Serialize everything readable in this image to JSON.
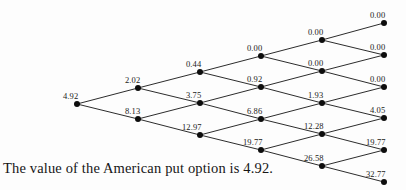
{
  "figure": {
    "caption": "The value of the American put option is 4.92.",
    "background_color": "#fdfdfd",
    "ink_color": "#111111"
  },
  "chart_data": {
    "type": "diagram",
    "subtype": "binomial-tree",
    "title": "",
    "xlabel": "",
    "ylabel": "",
    "steps": 5,
    "node_radius": 3.0,
    "edge_color": "#141414",
    "node_color": "#0d0d0d",
    "label_offset": {
      "dx": -13,
      "dy": -11
    },
    "columns": [
      {
        "index": 0,
        "x": 77,
        "nodes": [
          {
            "row": 0,
            "y": 104,
            "value": "4.92",
            "label_x": 63,
            "label_y": 92
          }
        ]
      },
      {
        "index": 1,
        "x": 138,
        "nodes": [
          {
            "row": 0,
            "y": 88,
            "value": "2.02",
            "label_x": 125,
            "label_y": 76
          },
          {
            "row": 1,
            "y": 119,
            "value": "8.13",
            "label_x": 125,
            "label_y": 107
          }
        ]
      },
      {
        "index": 2,
        "x": 200,
        "nodes": [
          {
            "row": 0,
            "y": 72,
            "value": "0.44",
            "label_x": 186,
            "label_y": 60
          },
          {
            "row": 1,
            "y": 103,
            "value": "3.75",
            "label_x": 186,
            "label_y": 91
          },
          {
            "row": 2,
            "y": 135,
            "value": "12.97",
            "label_x": 182,
            "label_y": 123
          }
        ]
      },
      {
        "index": 3,
        "x": 261,
        "nodes": [
          {
            "row": 0,
            "y": 56,
            "value": "0.00",
            "label_x": 247,
            "label_y": 44
          },
          {
            "row": 1,
            "y": 87,
            "value": "0.92",
            "label_x": 247,
            "label_y": 75
          },
          {
            "row": 2,
            "y": 119,
            "value": "6.86",
            "label_x": 247,
            "label_y": 107
          },
          {
            "row": 3,
            "y": 150,
            "value": "19.77",
            "label_x": 243,
            "label_y": 138
          }
        ]
      },
      {
        "index": 4,
        "x": 322,
        "nodes": [
          {
            "row": 0,
            "y": 40,
            "value": "0.00",
            "label_x": 308,
            "label_y": 28
          },
          {
            "row": 1,
            "y": 71,
            "value": "0.00",
            "label_x": 308,
            "label_y": 59
          },
          {
            "row": 2,
            "y": 103,
            "value": "1.93",
            "label_x": 308,
            "label_y": 91
          },
          {
            "row": 3,
            "y": 134,
            "value": "12.28",
            "label_x": 304,
            "label_y": 122
          },
          {
            "row": 4,
            "y": 166,
            "value": "26.58",
            "label_x": 304,
            "label_y": 154
          }
        ]
      },
      {
        "index": 5,
        "x": 384,
        "nodes": [
          {
            "row": 0,
            "y": 23,
            "value": "0.00",
            "label_x": 370,
            "label_y": 11
          },
          {
            "row": 1,
            "y": 55,
            "value": "0.00",
            "label_x": 370,
            "label_y": 43
          },
          {
            "row": 2,
            "y": 87,
            "value": "0.00",
            "label_x": 370,
            "label_y": 75
          },
          {
            "row": 3,
            "y": 118,
            "value": "4.05",
            "label_x": 370,
            "label_y": 106
          },
          {
            "row": 4,
            "y": 150,
            "value": "19.77",
            "label_x": 366,
            "label_y": 138
          },
          {
            "row": 5,
            "y": 182,
            "value": "32.77",
            "label_x": 366,
            "label_y": 170
          }
        ]
      }
    ],
    "edges": [
      {
        "from": [
          77,
          104
        ],
        "to": [
          138,
          88
        ]
      },
      {
        "from": [
          77,
          104
        ],
        "to": [
          138,
          119
        ]
      },
      {
        "from": [
          138,
          88
        ],
        "to": [
          200,
          72
        ]
      },
      {
        "from": [
          138,
          88
        ],
        "to": [
          200,
          103
        ]
      },
      {
        "from": [
          138,
          119
        ],
        "to": [
          200,
          103
        ]
      },
      {
        "from": [
          138,
          119
        ],
        "to": [
          200,
          135
        ]
      },
      {
        "from": [
          200,
          72
        ],
        "to": [
          261,
          56
        ]
      },
      {
        "from": [
          200,
          72
        ],
        "to": [
          261,
          87
        ]
      },
      {
        "from": [
          200,
          103
        ],
        "to": [
          261,
          87
        ]
      },
      {
        "from": [
          200,
          103
        ],
        "to": [
          261,
          119
        ]
      },
      {
        "from": [
          200,
          135
        ],
        "to": [
          261,
          119
        ]
      },
      {
        "from": [
          200,
          135
        ],
        "to": [
          261,
          150
        ]
      },
      {
        "from": [
          261,
          56
        ],
        "to": [
          322,
          40
        ]
      },
      {
        "from": [
          261,
          56
        ],
        "to": [
          322,
          71
        ]
      },
      {
        "from": [
          261,
          87
        ],
        "to": [
          322,
          71
        ]
      },
      {
        "from": [
          261,
          87
        ],
        "to": [
          322,
          103
        ]
      },
      {
        "from": [
          261,
          119
        ],
        "to": [
          322,
          103
        ]
      },
      {
        "from": [
          261,
          119
        ],
        "to": [
          322,
          134
        ]
      },
      {
        "from": [
          261,
          150
        ],
        "to": [
          322,
          134
        ]
      },
      {
        "from": [
          261,
          150
        ],
        "to": [
          322,
          166
        ]
      },
      {
        "from": [
          322,
          40
        ],
        "to": [
          384,
          23
        ]
      },
      {
        "from": [
          322,
          40
        ],
        "to": [
          384,
          55
        ]
      },
      {
        "from": [
          322,
          71
        ],
        "to": [
          384,
          55
        ]
      },
      {
        "from": [
          322,
          71
        ],
        "to": [
          384,
          87
        ]
      },
      {
        "from": [
          322,
          103
        ],
        "to": [
          384,
          87
        ]
      },
      {
        "from": [
          322,
          103
        ],
        "to": [
          384,
          118
        ]
      },
      {
        "from": [
          322,
          134
        ],
        "to": [
          384,
          118
        ]
      },
      {
        "from": [
          322,
          134
        ],
        "to": [
          384,
          150
        ]
      },
      {
        "from": [
          322,
          166
        ],
        "to": [
          384,
          150
        ]
      },
      {
        "from": [
          322,
          166
        ],
        "to": [
          384,
          182
        ]
      }
    ],
    "values_flat": [
      "4.92",
      "2.02",
      "8.13",
      "0.44",
      "3.75",
      "12.97",
      "0.00",
      "0.92",
      "6.86",
      "19.77",
      "0.00",
      "0.00",
      "1.93",
      "12.28",
      "26.58",
      "0.00",
      "0.00",
      "0.00",
      "4.05",
      "19.77",
      "32.77"
    ],
    "root_value": "4.92"
  }
}
